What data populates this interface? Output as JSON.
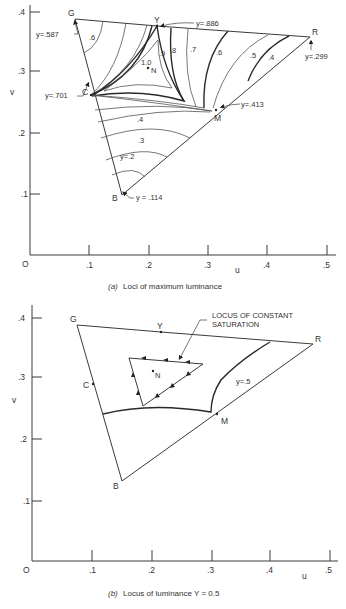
{
  "figure_a": {
    "caption_prefix": "(a)",
    "caption": "Loci of maximum luminance",
    "axis": {
      "xlabel": "u",
      "ylabel": "v",
      "origin_label": "O",
      "x_ticks": [
        ".1",
        ".2",
        ".3",
        ".4",
        ".5"
      ],
      "y_ticks": [
        ".1",
        ".2",
        ".3",
        ".4"
      ]
    },
    "vertices": {
      "G": "G",
      "Y": "Y",
      "R": "R",
      "C": "C",
      "M": "M",
      "B": "B",
      "N": "N"
    },
    "annotations": {
      "G": "y=.587",
      "Y": "y=.886",
      "R": "y=.299",
      "C": "y=.701",
      "M": "y=.413",
      "B": "y = .114"
    },
    "contour_labels": [
      ".6",
      ".9",
      ".8",
      ".7",
      ".6",
      ".5",
      ".4",
      "1.0",
      ".4",
      ".3",
      "y=.2"
    ]
  },
  "figure_b": {
    "caption_prefix": "(b)",
    "caption": "Locus of luminance Y = 0.5",
    "axis": {
      "xlabel": "u",
      "ylabel": "v",
      "origin_label": "O",
      "x_ticks": [
        ".1",
        ".2",
        ".3",
        ".4",
        ".5"
      ],
      "y_ticks": [
        ".1",
        ".2",
        ".3",
        ".4"
      ]
    },
    "vertices": {
      "G": "G",
      "Y": "Y",
      "R": "R",
      "C": "C",
      "M": "M",
      "B": "B",
      "N": "N"
    },
    "callout_line1": "LOCUS OF CONSTANT",
    "callout_line2": "SATURATION",
    "curve_label": "y=.5"
  }
}
